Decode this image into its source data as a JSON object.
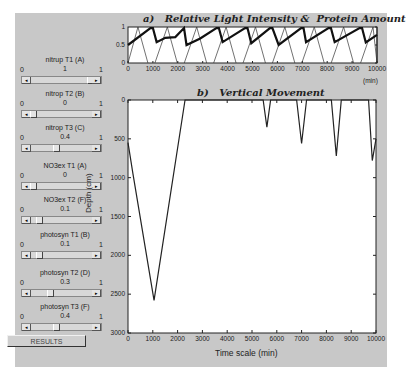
{
  "controls": [
    {
      "label": "nitrup T1 (A)",
      "min": "0",
      "max": "1",
      "value": "1",
      "pos": 1.0
    },
    {
      "label": "nitrop T2 (B)",
      "min": "0",
      "max": "1",
      "value": "0",
      "pos": 0.0
    },
    {
      "label": "nitrop T3 (C)",
      "min": "0",
      "max": "1",
      "value": "0.4",
      "pos": 0.4
    },
    {
      "label": "NO3ex T1 (A)",
      "min": "0",
      "max": "1",
      "value": "0",
      "pos": 0.0
    },
    {
      "label": "NO3ex T2 (F)",
      "min": "0",
      "max": "1",
      "value": "0.1",
      "pos": 0.1
    },
    {
      "label": "photosyn T1 (B)",
      "min": "0",
      "max": "1",
      "value": "0.1",
      "pos": 0.1
    },
    {
      "label": "photosyn T2 (D)",
      "min": "0",
      "max": "1",
      "value": "0.3",
      "pos": 0.3
    },
    {
      "label": "photosyn T3 (F)",
      "min": "0",
      "max": "1",
      "value": "0.4",
      "pos": 0.4
    }
  ],
  "results_button": "RESULTS",
  "arrows": {
    "left": "◂",
    "right": "▸"
  },
  "chart_data": [
    {
      "type": "line",
      "title": "a)   Relative Light Intensity &  Protein Amount",
      "xlabel": "(min)",
      "ylabel": "",
      "xlim": [
        0,
        10000
      ],
      "ylim": [
        0,
        1
      ],
      "xticks": [
        "0",
        "1000",
        "2000",
        "3000",
        "4000",
        "5000",
        "6000",
        "7000",
        "8000",
        "9000",
        "10000"
      ],
      "yticks": [
        "0",
        "0.5",
        "1"
      ],
      "series": [
        {
          "name": "Protein Amount (thick)",
          "x": [
            0,
            900,
            1000,
            1150,
            1500,
            1900,
            2250,
            2350,
            2900,
            3550,
            3650,
            3800,
            4700,
            4800,
            4950,
            5700,
            5800,
            6050,
            6950,
            7050,
            7150,
            8050,
            8150,
            8300,
            9300,
            9400,
            9550,
            10000
          ],
          "y": [
            0.5,
            0.97,
            0.97,
            0.58,
            0.7,
            0.72,
            0.97,
            0.5,
            0.68,
            0.97,
            0.97,
            0.58,
            0.97,
            0.97,
            0.55,
            0.97,
            0.97,
            0.5,
            0.97,
            0.97,
            0.58,
            0.97,
            0.97,
            0.58,
            0.97,
            0.97,
            0.57,
            0.78
          ]
        },
        {
          "name": "Relative Light Intensity (thin)",
          "periodic": "triangular day/night cycle, period ~1200 min, peaks ~1.0, zero at night"
        }
      ]
    },
    {
      "type": "line",
      "title": "b)   Vertical Movement",
      "xlabel": "Time scale (min)",
      "ylabel": "Depth (cm)",
      "xlim": [
        0,
        10000
      ],
      "ylim": [
        3000,
        0
      ],
      "xticks": [
        "0",
        "1000",
        "2000",
        "3000",
        "4000",
        "5000",
        "6000",
        "7000",
        "8000",
        "9000",
        "10000"
      ],
      "yticks": [
        "0",
        "500",
        "1000",
        "1500",
        "2000",
        "2500",
        "3000"
      ],
      "series": [
        {
          "name": "Depth",
          "x": [
            0,
            200,
            1050,
            2300,
            2400,
            5450,
            5600,
            5750,
            6800,
            7000,
            7200,
            8200,
            8400,
            8600,
            9700,
            9850,
            10000
          ],
          "y": [
            550,
            950,
            2580,
            0,
            0,
            0,
            350,
            0,
            0,
            560,
            0,
            0,
            720,
            0,
            0,
            780,
            500
          ]
        }
      ]
    }
  ]
}
